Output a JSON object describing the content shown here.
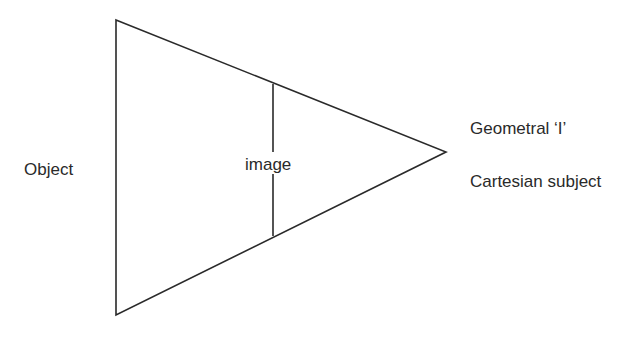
{
  "diagram": {
    "labels": {
      "object": "Object",
      "image": "image",
      "geometral": "Geometral ‘I’",
      "cartesian": "Cartesian subject"
    },
    "shapes": {
      "triangle": {
        "points": [
          [
            116,
            20
          ],
          [
            446,
            152
          ],
          [
            116,
            315
          ]
        ],
        "stroke": "#2a2a2a"
      },
      "image_line": {
        "x": 273,
        "y1": 84,
        "y2": 236,
        "stroke": "#2a2a2a"
      }
    }
  }
}
